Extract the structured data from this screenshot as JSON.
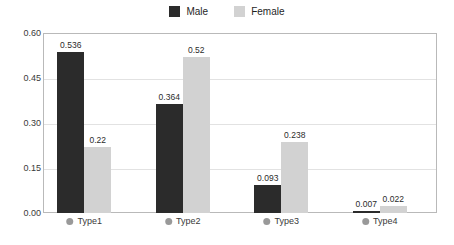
{
  "chart_data": {
    "type": "bar",
    "title": "",
    "subtitle": "",
    "xlabel": "",
    "ylabel": "",
    "categories": [
      "Type1",
      "Type2",
      "Type3",
      "Type4"
    ],
    "series": [
      {
        "name": "Male",
        "color": "#2b2b2b",
        "values": [
          0.536,
          0.364,
          0.093,
          0.007
        ]
      },
      {
        "name": "Female",
        "color": "#d2d2d2",
        "values": [
          0.22,
          0.52,
          0.238,
          0.022
        ]
      }
    ],
    "value_labels": [
      [
        "0.536",
        "0.22"
      ],
      [
        "0.364",
        "0.52"
      ],
      [
        "0.093",
        "0.238"
      ],
      [
        "0.007",
        "0.022"
      ]
    ],
    "ylim": [
      0,
      0.6
    ],
    "yticks": [
      0.0,
      0.15,
      0.3,
      0.45,
      0.6
    ],
    "ytick_labels": [
      "0.00",
      "0.15",
      "0.30",
      "0.45",
      "0.60"
    ],
    "grid": true,
    "legend_position": "top-center",
    "legend": [
      "Male",
      "Female"
    ]
  },
  "colors": {
    "male_bar": "#2b2b2b",
    "female_bar": "#d2d2d2",
    "gridline": "#e2e2e2",
    "frame": "#b9b9b9",
    "category_bullet": "#999999",
    "text": "#3a3a3a",
    "background": "#ffffff"
  }
}
